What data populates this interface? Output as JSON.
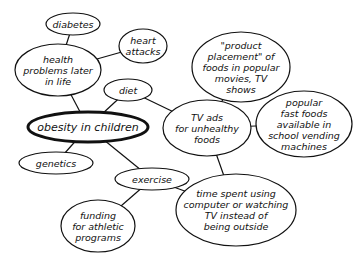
{
  "diagram": {
    "type": "concept-map",
    "central_node": "obesity",
    "nodes": [
      {
        "id": "diabetes",
        "label": "diabetes",
        "cx": 73,
        "cy": 24,
        "rx": 27,
        "ry": 11
      },
      {
        "id": "heart",
        "label": "heart\nattacks",
        "cx": 143,
        "cy": 46,
        "rx": 24,
        "ry": 17
      },
      {
        "id": "health",
        "label": "health\nproblems later\nin life",
        "cx": 58,
        "cy": 70,
        "rx": 43,
        "ry": 26
      },
      {
        "id": "diet",
        "label": "diet",
        "cx": 128,
        "cy": 90,
        "rx": 24,
        "ry": 11
      },
      {
        "id": "obesity",
        "label": "obesity in children",
        "cx": 88,
        "cy": 127,
        "rx": 60,
        "ry": 15
      },
      {
        "id": "genetics",
        "label": "genetics",
        "cx": 56,
        "cy": 163,
        "rx": 37,
        "ry": 11
      },
      {
        "id": "product",
        "label": "\"product\nplacement\" of\nfoods in popular\nmovies, TV\nshows",
        "cx": 241,
        "cy": 67,
        "rx": 49,
        "ry": 35
      },
      {
        "id": "tvads",
        "label": "TV ads\nfor unhealthy\nfoods",
        "cx": 207,
        "cy": 128,
        "rx": 44,
        "ry": 28
      },
      {
        "id": "fastfood",
        "label": "popular\nfast foods\navailable in\nschool vending\nmachines",
        "cx": 304,
        "cy": 124,
        "rx": 48,
        "ry": 33
      },
      {
        "id": "exercise",
        "label": "exercise",
        "cx": 152,
        "cy": 179,
        "rx": 37,
        "ry": 11
      },
      {
        "id": "funding",
        "label": "funding\nfor athletic\nprograms",
        "cx": 98,
        "cy": 226,
        "rx": 37,
        "ry": 26
      },
      {
        "id": "timespent",
        "label": "time spent using\ncomputer or watching\nTV instead of\nbeing outside",
        "cx": 236,
        "cy": 210,
        "rx": 60,
        "ry": 36
      }
    ],
    "edges": [
      [
        "diabetes",
        "health"
      ],
      [
        "heart",
        "health"
      ],
      [
        "health",
        "obesity"
      ],
      [
        "diet",
        "obesity"
      ],
      [
        "diet",
        "tvads"
      ],
      [
        "product",
        "tvads"
      ],
      [
        "tvads",
        "fastfood"
      ],
      [
        "obesity",
        "genetics"
      ],
      [
        "obesity",
        "exercise"
      ],
      [
        "exercise",
        "funding"
      ],
      [
        "exercise",
        "timespent"
      ],
      [
        "tvads",
        "timespent"
      ]
    ],
    "colors": {
      "stroke": "#111111",
      "fill": "#ffffff",
      "text": "#111111"
    }
  }
}
